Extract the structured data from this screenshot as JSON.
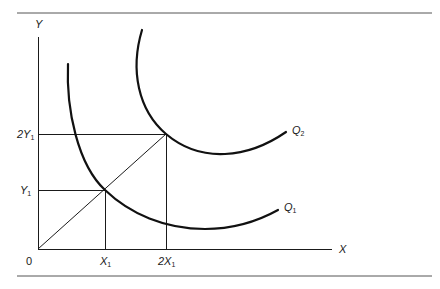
{
  "figure": {
    "type": "isoquant-diagram",
    "axes": {
      "y_label": "Y",
      "x_label": "X",
      "origin_label": "0"
    },
    "y_ticks": [
      {
        "main": "2Y",
        "sub": "1"
      },
      {
        "main": "Y",
        "sub": "1"
      }
    ],
    "x_ticks": [
      {
        "main": "X",
        "sub": "1"
      },
      {
        "main": "2X",
        "sub": "1"
      }
    ],
    "curves": [
      {
        "name": "Q1",
        "main": "Q",
        "sub": "1"
      },
      {
        "name": "Q2",
        "main": "Q",
        "sub": "2"
      }
    ],
    "colors": {
      "ink": "#1a1a1a",
      "rule": "#555555",
      "background": "#ffffff"
    }
  }
}
